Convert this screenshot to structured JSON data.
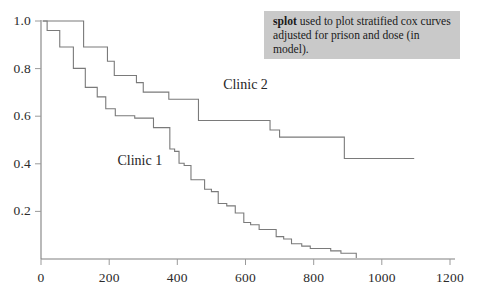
{
  "figure": {
    "background_color": "#ffffff",
    "axis_color": "#808080",
    "curve_color": "#7a7a7a",
    "text_color": "#2b2b2b"
  },
  "annotation": {
    "command": "splot",
    "text": " used to plot stratified cox curves adjusted for prison and dose (in model).",
    "full_text": "splot used to plot stratified cox curves adjusted for prison and dose (in model).",
    "background_color": "#c9c9c9"
  },
  "labels": {
    "clinic1": "Clinic 1",
    "clinic2": "Clinic 2"
  },
  "chart_data": {
    "type": "line",
    "title": "",
    "xlabel": "",
    "ylabel": "",
    "xlim": [
      0,
      1200
    ],
    "ylim": [
      0.0,
      1.0
    ],
    "xticks": [
      0,
      200,
      400,
      600,
      800,
      1000,
      1200
    ],
    "xtick_labels": [
      "0",
      "200",
      "400",
      "600",
      "800",
      "1000",
      "1200"
    ],
    "yticks": [
      0.2,
      0.4,
      0.6,
      0.8,
      1.0
    ],
    "ytick_labels": [
      "0.2",
      "0.4",
      "0.6",
      "0.8",
      "1.0"
    ],
    "grid": false,
    "legend": "inline-annotations",
    "step_style": "post",
    "series": [
      {
        "name": "Clinic 1",
        "label_position": {
          "x": 290,
          "y": 0.41
        },
        "x": [
          5,
          18,
          55,
          95,
          130,
          165,
          190,
          218,
          245,
          275,
          300,
          330,
          355,
          378,
          392,
          405,
          420,
          440,
          460,
          480,
          500,
          520,
          545,
          570,
          595,
          615,
          640,
          665,
          690,
          712,
          735,
          765,
          790,
          820,
          850,
          880,
          915,
          925
        ],
        "y": [
          1.0,
          0.96,
          0.89,
          0.8,
          0.72,
          0.68,
          0.63,
          0.6,
          0.6,
          0.59,
          0.59,
          0.55,
          0.55,
          0.46,
          0.45,
          0.4,
          0.39,
          0.33,
          0.33,
          0.29,
          0.28,
          0.23,
          0.22,
          0.19,
          0.15,
          0.14,
          0.12,
          0.12,
          0.09,
          0.08,
          0.06,
          0.05,
          0.04,
          0.04,
          0.03,
          0.02,
          0.02,
          0.0
        ]
      },
      {
        "name": "Clinic 2",
        "label_position": {
          "x": 600,
          "y": 0.73
        },
        "x": [
          5,
          60,
          125,
          165,
          195,
          215,
          245,
          280,
          300,
          350,
          375,
          455,
          462,
          660,
          672,
          700,
          880,
          890,
          1095
        ],
        "y": [
          1.0,
          1.0,
          0.89,
          0.89,
          0.83,
          0.77,
          0.77,
          0.74,
          0.7,
          0.7,
          0.67,
          0.67,
          0.58,
          0.58,
          0.54,
          0.51,
          0.51,
          0.42,
          0.42
        ]
      }
    ]
  }
}
